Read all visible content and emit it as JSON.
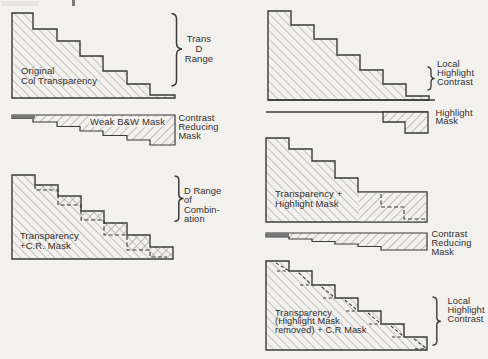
{
  "colors": {
    "paper": "#f3f1ee",
    "ink": "#3a3a3a",
    "hatch": "#9a9a9a"
  },
  "labels": {
    "fig_l1": {
      "inner": [
        "Original",
        "Col Transparency"
      ],
      "brace": [
        "Trans",
        "D",
        "Range"
      ]
    },
    "fig_l2": {
      "inner": "Weak B&W Mask",
      "side": [
        "Contrast",
        "Reducing",
        "Mask"
      ]
    },
    "fig_l3": {
      "inner": [
        "Transparency",
        "+C.R. Mask"
      ],
      "brace": [
        "D Range",
        "of",
        "Combin-",
        "ation"
      ]
    },
    "fig_r1": {
      "brace": [
        "Local",
        "Highlight",
        "Contrast"
      ]
    },
    "fig_r2": {
      "side": [
        "Highlight",
        "Mask"
      ]
    },
    "fig_r3": {
      "inner": [
        "Transparency +",
        "Highlight Mask"
      ]
    },
    "fig_r4": {
      "side": [
        "Contrast",
        "Reducing",
        "Mask"
      ]
    },
    "fig_r5": {
      "inner": [
        "Transparency",
        "(Highlight Mask",
        "removed) + C.R Mask"
      ],
      "brace": [
        "Local",
        "Highlight",
        "Contrast"
      ]
    }
  }
}
